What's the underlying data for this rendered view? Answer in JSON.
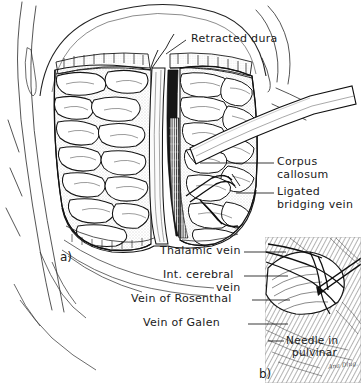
{
  "figure": {
    "type": "medical-surgical-illustration",
    "style": "pen-and-ink line drawing, black on white",
    "signature": "Ana Dlug."
  },
  "panels": [
    {
      "id": "a",
      "id_label": "a)",
      "caption": "Operative exposure: retracted dura, interhemispheric fissure, corpus callosum and ligated bridging vein"
    },
    {
      "id": "b",
      "id_label": "b)",
      "caption": "Close-up inset: needle in pulvinar with deep venous anatomy"
    }
  ],
  "labels": [
    {
      "key": "retracted_dura",
      "text": "Retracted dura",
      "panel": "a"
    },
    {
      "key": "corpus_callosum_l1",
      "text": "Corpus",
      "panel": "a"
    },
    {
      "key": "corpus_callosum_l2",
      "text": "callosum",
      "panel": "a"
    },
    {
      "key": "ligated_l1",
      "text": "Ligated",
      "panel": "a"
    },
    {
      "key": "ligated_l2",
      "text": "bridging vein",
      "panel": "a"
    },
    {
      "key": "thalamic_vein",
      "text": "Thalamic vein",
      "panel": "b"
    },
    {
      "key": "int_cerebral_l1",
      "text": "Int. cerebral",
      "panel": "b"
    },
    {
      "key": "int_cerebral_l2",
      "text": "vein",
      "panel": "b"
    },
    {
      "key": "vein_rosenthal",
      "text": "Vein of Rosenthal",
      "panel": "b"
    },
    {
      "key": "vein_galen",
      "text": "Vein of Galen",
      "panel": "b"
    },
    {
      "key": "needle_l1",
      "text": "Needle in",
      "panel": "b"
    },
    {
      "key": "needle_l2",
      "text": "pulvinar",
      "panel": "b"
    }
  ],
  "anatomy_parts": [
    "scalp flap",
    "craniotomy edge",
    "retracted dura mater",
    "left cerebral hemisphere gyri",
    "right cerebral hemisphere gyri",
    "falx cerebri",
    "corpus callosum",
    "ligated bridging vein",
    "brain retractor blade",
    "thalamic vein",
    "internal cerebral vein",
    "vein of Rosenthal",
    "vein of Galen",
    "needle in pulvinar"
  ],
  "colors": {
    "ink": "#111111",
    "paper": "#ffffff",
    "stipple": "#8c8c8c",
    "shadow": "#3a3a3a",
    "mid": "#5e5e5e"
  }
}
